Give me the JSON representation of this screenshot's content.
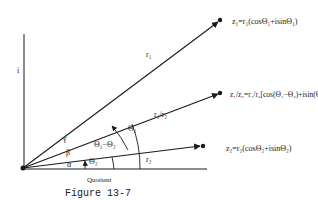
{
  "figure": {
    "caption": "Figure 13-7",
    "subtitle": "Quotient",
    "axis_label_imag": "i"
  },
  "vectors": {
    "z1": {
      "label": "z₁=r₁(cosΘ₁+isinΘ₁)",
      "magnitude_label": "r₁"
    },
    "quotient": {
      "label": "z₁/z₂=r₁/r₂[cos(Θ₁−Θ₂)+isin(Θ₁−Θ₂)]",
      "magnitude_label": "r₁/r₂"
    },
    "z2": {
      "label": "z₂=r₂(cosΘ₂+isinΘ₂)",
      "magnitude_label": "r₂"
    }
  },
  "angles": {
    "theta1": "Θ₁",
    "theta2": "Θ₂",
    "theta_diff": "Θ₁−Θ₂",
    "alpha": "α",
    "beta": "β",
    "gamma": "γ"
  },
  "colors": {
    "ink": "#1a1a1a",
    "background": "#ffffff"
  }
}
